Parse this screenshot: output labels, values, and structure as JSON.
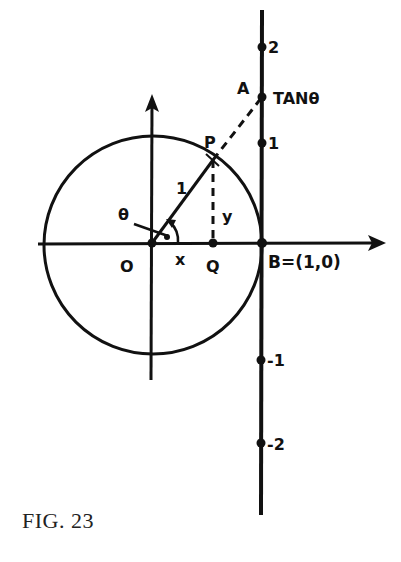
{
  "figure": {
    "caption": "FIG. 23",
    "labels": {
      "origin": "O",
      "point_p": "P",
      "point_q": "Q",
      "point_a": "A",
      "point_b": "B=(1,0)",
      "theta": "θ",
      "radius": "1",
      "x_segment": "x",
      "y_segment": "y",
      "tan_label": "TANθ"
    },
    "tangent_ticks": [
      {
        "label": "2",
        "value": 2
      },
      {
        "label": "1",
        "value": 1
      },
      {
        "label": "-1",
        "value": -1
      },
      {
        "label": "-2",
        "value": -2
      }
    ],
    "colors": {
      "ink": "#111111",
      "paper": "#ffffff"
    }
  }
}
